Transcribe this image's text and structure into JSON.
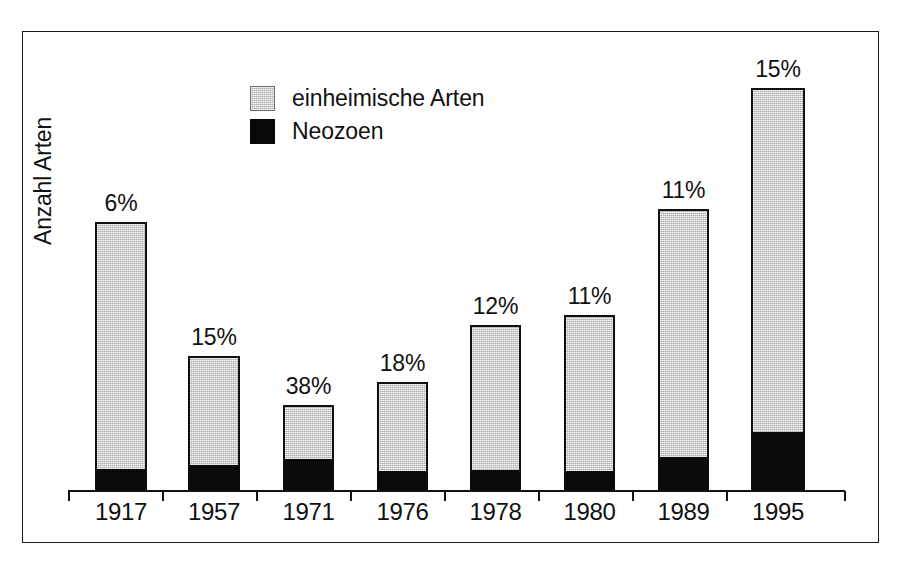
{
  "chart_data": {
    "type": "bar",
    "subtype": "stacked-bar",
    "title": "",
    "xlabel": "",
    "ylabel": "Anzahl Arten",
    "grid": false,
    "legend_position": "top-center",
    "categories": [
      "1917",
      "1957",
      "1971",
      "1976",
      "1978",
      "1980",
      "1989",
      "1995"
    ],
    "series": [
      {
        "name": "einheimische Arten",
        "color": "#c9c9c9",
        "values": [
          60,
          35,
          19,
          21,
          32,
          35,
          57,
          79
        ]
      },
      {
        "name": "Neozoen",
        "color": "#0b0b0b",
        "values": [
          4,
          6,
          12,
          5,
          4,
          4,
          7,
          14
        ]
      }
    ],
    "totals": [
      64,
      41,
      31,
      26,
      36,
      39,
      64,
      93
    ],
    "data_labels": [
      "6%",
      "15%",
      "38%",
      "18%",
      "12%",
      "11%",
      "11%",
      "15%"
    ],
    "data_label_values": [
      6,
      15,
      38,
      18,
      12,
      11,
      11,
      15
    ],
    "data_label_meaning": "Anteil Neozoen am Gesamtartenbestand",
    "ylim": [
      0,
      100
    ],
    "y_ticks_visible": false,
    "axis_color": "#111111",
    "frame_color": "#1b1b1b",
    "background": "#ffffff"
  },
  "legend": {
    "items": [
      {
        "label": "einheimische Arten",
        "swatch": "native"
      },
      {
        "label": "Neozoen",
        "swatch": "neozoen"
      }
    ]
  },
  "axes": {
    "y_title": "Anzahl Arten"
  },
  "bars": [
    {
      "year": "1917",
      "pct": "6%",
      "x": 95,
      "w": 52,
      "top": 222,
      "neo_h": 22
    },
    {
      "year": "1957",
      "pct": "15%",
      "x": 188,
      "w": 52,
      "top": 356,
      "neo_h": 26
    },
    {
      "year": "1971",
      "pct": "38%",
      "x": 283,
      "w": 51,
      "top": 405,
      "neo_h": 32
    },
    {
      "year": "1976",
      "pct": "18%",
      "x": 377,
      "w": 51,
      "top": 382,
      "neo_h": 20
    },
    {
      "year": "1978",
      "pct": "12%",
      "x": 470,
      "w": 51,
      "top": 325,
      "neo_h": 21
    },
    {
      "year": "1980",
      "pct": "11%",
      "x": 564,
      "w": 51,
      "top": 315,
      "neo_h": 20
    },
    {
      "year": "1989",
      "pct": "11%",
      "x": 658,
      "w": 51,
      "top": 209,
      "neo_h": 34
    },
    {
      "year": "1995",
      "pct": "15%",
      "x": 751,
      "w": 54,
      "top": 88,
      "neo_h": 59
    }
  ],
  "ticks": [
    68,
    162,
    256,
    350,
    444,
    538,
    632,
    726,
    844
  ]
}
